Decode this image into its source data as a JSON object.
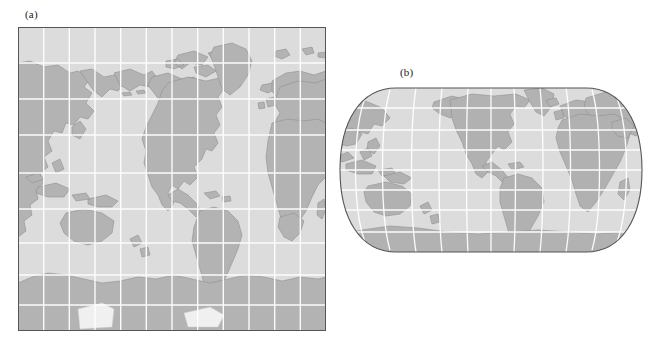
{
  "figure": {
    "background_color": "#ffffff",
    "panels": [
      {
        "id": "a",
        "label": "(a)",
        "projection_name": "mercator",
        "description": "rectangular world map with straight graticule",
        "frame": {
          "x": 18,
          "y": 27,
          "width": 308,
          "height": 304
        },
        "center_longitude": -150,
        "graticule_interval_degrees": 30,
        "has_frame_border": true,
        "colors": {
          "ocean": "#dcdcdc",
          "land": "#b3b3b3",
          "land_outline": "#8c8c8c",
          "ice_shelf": "#f2f2f2",
          "graticule": "#ffffff",
          "frame": "#555555"
        }
      },
      {
        "id": "b",
        "label": "(b)",
        "projection_name": "eckert-robinson",
        "description": "rounded pseudocylindrical world map with curved meridians",
        "frame": {
          "x": 338,
          "y": 86,
          "width": 306,
          "height": 168
        },
        "center_longitude": -150,
        "graticule_interval_degrees": 30,
        "has_frame_border": true,
        "colors": {
          "ocean": "#dcdcdc",
          "land": "#b3b3b3",
          "land_outline": "#8c8c8c",
          "ice_shelf": "#f2f2f2",
          "graticule": "#ffffff",
          "frame": "#555555"
        }
      }
    ]
  }
}
